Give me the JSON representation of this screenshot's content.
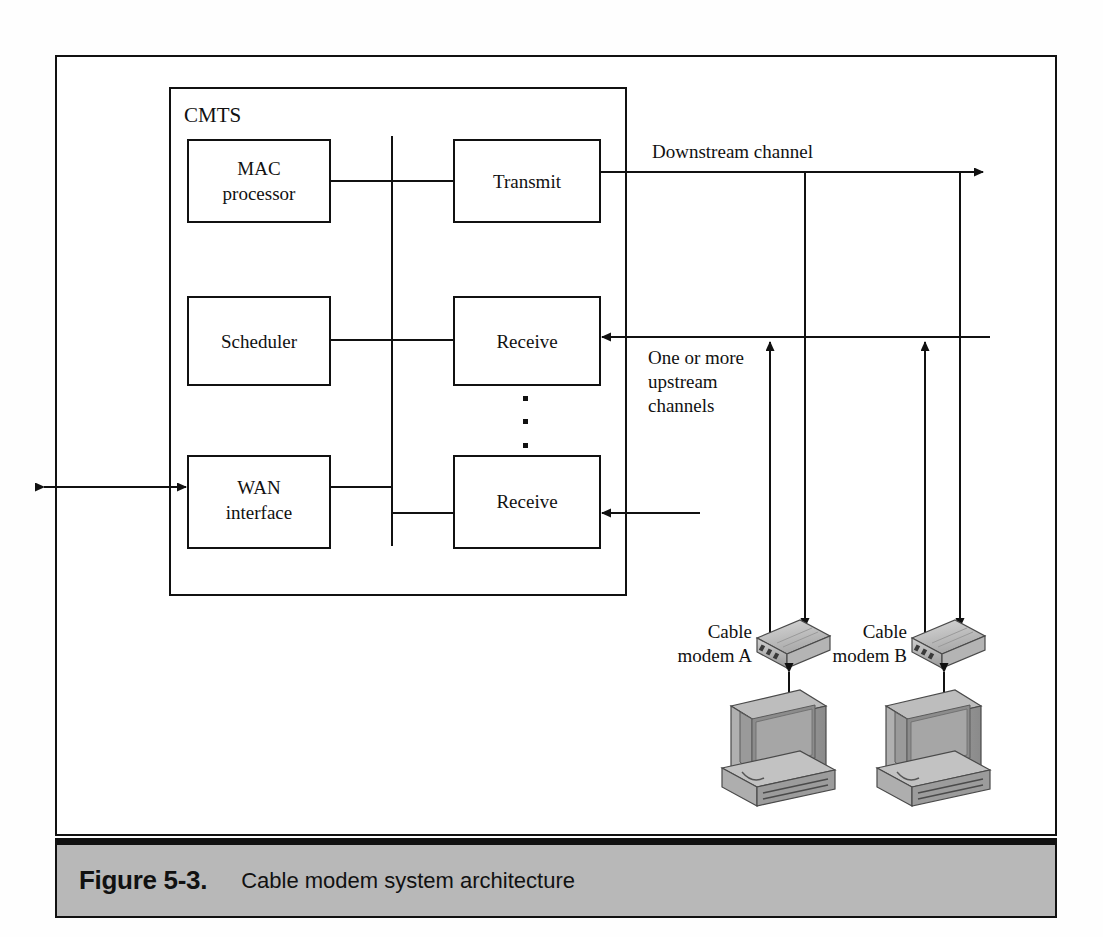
{
  "figure": {
    "number": "Figure 5-3.",
    "title": "Cable modem system architecture"
  },
  "diagram": {
    "type": "block-diagram",
    "container": {
      "name": "CMTS",
      "label": "CMTS"
    },
    "blocks": [
      {
        "id": "mac-processor",
        "lines": [
          "MAC",
          "processor"
        ],
        "x": 188,
        "y": 140,
        "w": 142,
        "h": 82
      },
      {
        "id": "transmit",
        "lines": [
          "Transmit"
        ],
        "x": 454,
        "y": 140,
        "w": 146,
        "h": 82
      },
      {
        "id": "scheduler",
        "lines": [
          "Scheduler"
        ],
        "x": 188,
        "y": 297,
        "w": 142,
        "h": 88
      },
      {
        "id": "receive-upper",
        "lines": [
          "Receive"
        ],
        "x": 454,
        "y": 297,
        "w": 146,
        "h": 88
      },
      {
        "id": "wan-interface",
        "lines": [
          "WAN",
          "interface"
        ],
        "x": 188,
        "y": 456,
        "w": 142,
        "h": 92
      },
      {
        "id": "receive-lower",
        "lines": [
          "Receive"
        ],
        "x": 454,
        "y": 456,
        "w": 146,
        "h": 92
      }
    ],
    "annotations": [
      {
        "id": "downstream-channel",
        "text": "Downstream channel"
      },
      {
        "id": "upstream-channels-line1",
        "text": "One or more"
      },
      {
        "id": "upstream-channels-line2",
        "text": "upstream"
      },
      {
        "id": "upstream-channels-line3",
        "text": "channels"
      }
    ],
    "devices": [
      {
        "id": "cable-modem-a",
        "line1": "Cable",
        "line2": "modem A"
      },
      {
        "id": "cable-modem-b",
        "line1": "Cable",
        "line2": "modem B"
      }
    ],
    "ellipsis_dots": 3,
    "colors": {
      "line": "#111111",
      "caption_band": "#b8b8b8",
      "device_body": "#c8c8c8",
      "device_shade": "#8f8f8f"
    }
  }
}
